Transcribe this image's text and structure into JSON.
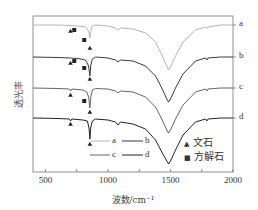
{
  "chart_data": {
    "type": "line",
    "title": "",
    "xlabel": "波数/cm⁻¹",
    "ylabel": "透光率",
    "xlim": [
      400,
      2000
    ],
    "x_ticks": [
      500,
      1000,
      1500,
      2000
    ],
    "x_minor_ticks": [
      750,
      1250,
      1750
    ],
    "grid": false,
    "legend_position": "inside lower middle/right",
    "series": [
      {
        "name": "a",
        "color": "#b5b5b5",
        "label_y": 25,
        "points": [
          [
            400,
            25
          ],
          [
            600,
            25
          ],
          [
            680,
            25.5
          ],
          [
            760,
            26
          ],
          [
            820,
            27
          ],
          [
            845,
            31
          ],
          [
            855,
            38
          ],
          [
            862,
            31
          ],
          [
            875,
            26
          ],
          [
            900,
            25
          ],
          [
            1000,
            26
          ],
          [
            1060,
            28
          ],
          [
            1080,
            30
          ],
          [
            1100,
            28
          ],
          [
            1200,
            29
          ],
          [
            1300,
            33
          ],
          [
            1380,
            42
          ],
          [
            1430,
            55
          ],
          [
            1470,
            66
          ],
          [
            1485,
            70
          ],
          [
            1500,
            67
          ],
          [
            1540,
            56
          ],
          [
            1600,
            42
          ],
          [
            1700,
            30
          ],
          [
            1780,
            27
          ],
          [
            1790,
            28.5
          ],
          [
            1800,
            27
          ],
          [
            1900,
            25
          ],
          [
            2000,
            25
          ]
        ]
      },
      {
        "name": "b",
        "color": "#3a3a3a",
        "label_y": 57,
        "points": [
          [
            400,
            57
          ],
          [
            600,
            57.5
          ],
          [
            700,
            58
          ],
          [
            760,
            58.5
          ],
          [
            820,
            60
          ],
          [
            845,
            66
          ],
          [
            855,
            76
          ],
          [
            862,
            65
          ],
          [
            875,
            59
          ],
          [
            900,
            57
          ],
          [
            1000,
            58
          ],
          [
            1060,
            60
          ],
          [
            1080,
            62
          ],
          [
            1100,
            60
          ],
          [
            1200,
            61
          ],
          [
            1300,
            66
          ],
          [
            1380,
            76
          ],
          [
            1430,
            88
          ],
          [
            1470,
            99
          ],
          [
            1485,
            102
          ],
          [
            1500,
            99
          ],
          [
            1540,
            88
          ],
          [
            1600,
            74
          ],
          [
            1700,
            61
          ],
          [
            1780,
            58
          ],
          [
            1790,
            60
          ],
          [
            1800,
            58
          ],
          [
            1900,
            57
          ],
          [
            2000,
            57
          ]
        ]
      },
      {
        "name": "c",
        "color": "#666666",
        "label_y": 88,
        "points": [
          [
            400,
            88
          ],
          [
            600,
            88.5
          ],
          [
            690,
            89
          ],
          [
            700,
            91
          ],
          [
            710,
            89
          ],
          [
            800,
            90
          ],
          [
            830,
            92
          ],
          [
            845,
            97
          ],
          [
            855,
            108
          ],
          [
            862,
            97
          ],
          [
            875,
            90
          ],
          [
            900,
            88.5
          ],
          [
            1000,
            89
          ],
          [
            1060,
            91
          ],
          [
            1080,
            93
          ],
          [
            1100,
            91
          ],
          [
            1200,
            92
          ],
          [
            1300,
            97
          ],
          [
            1380,
            107
          ],
          [
            1430,
            119
          ],
          [
            1470,
            130
          ],
          [
            1485,
            133
          ],
          [
            1500,
            130
          ],
          [
            1540,
            119
          ],
          [
            1600,
            105
          ],
          [
            1700,
            92
          ],
          [
            1780,
            89
          ],
          [
            1790,
            91
          ],
          [
            1800,
            89
          ],
          [
            1900,
            88
          ],
          [
            2000,
            88
          ]
        ]
      },
      {
        "name": "d",
        "color": "#222222",
        "label_y": 118,
        "points": [
          [
            400,
            118
          ],
          [
            600,
            118.5
          ],
          [
            690,
            119
          ],
          [
            700,
            121
          ],
          [
            710,
            119
          ],
          [
            800,
            120
          ],
          [
            835,
            121
          ],
          [
            848,
            128
          ],
          [
            855,
            139
          ],
          [
            862,
            127
          ],
          [
            875,
            121
          ],
          [
            900,
            119
          ],
          [
            1000,
            120
          ],
          [
            1060,
            122
          ],
          [
            1080,
            125
          ],
          [
            1100,
            122
          ],
          [
            1200,
            124
          ],
          [
            1300,
            129
          ],
          [
            1380,
            140
          ],
          [
            1430,
            152
          ],
          [
            1470,
            161
          ],
          [
            1485,
            164
          ],
          [
            1500,
            161
          ],
          [
            1540,
            150
          ],
          [
            1600,
            135
          ],
          [
            1700,
            122
          ],
          [
            1780,
            119
          ],
          [
            1790,
            121
          ],
          [
            1800,
            119
          ],
          [
            1900,
            118
          ],
          [
            2000,
            118
          ]
        ]
      }
    ],
    "markers": [
      {
        "type": "triangle",
        "meaning": "文石",
        "wn": 700,
        "y": 31
      },
      {
        "type": "square",
        "meaning": "方解石",
        "wn": 730,
        "y": 30
      },
      {
        "type": "square",
        "meaning": "方解石",
        "wn": 810,
        "y": 40
      },
      {
        "type": "triangle",
        "meaning": "文石",
        "wn": 855,
        "y": 48
      },
      {
        "type": "triangle",
        "meaning": "文石",
        "wn": 700,
        "y": 63
      },
      {
        "type": "square",
        "meaning": "方解石",
        "wn": 730,
        "y": 61
      },
      {
        "type": "square",
        "meaning": "方解石",
        "wn": 810,
        "y": 68
      },
      {
        "type": "triangle",
        "meaning": "文石",
        "wn": 855,
        "y": 79
      },
      {
        "type": "triangle",
        "meaning": "文石",
        "wn": 700,
        "y": 95
      },
      {
        "type": "square",
        "meaning": "方解石",
        "wn": 810,
        "y": 101
      },
      {
        "type": "triangle",
        "meaning": "文石",
        "wn": 855,
        "y": 112
      },
      {
        "type": "triangle",
        "meaning": "文石",
        "wn": 700,
        "y": 124
      },
      {
        "type": "triangle",
        "meaning": "文石",
        "wn": 855,
        "y": 144
      }
    ],
    "legend": {
      "series_rows": [
        [
          "a",
          "b"
        ],
        [
          "c",
          "d"
        ]
      ],
      "symbols": [
        {
          "symbol": "▲",
          "label": "文石"
        },
        {
          "symbol": "■",
          "label": "方解石"
        }
      ]
    },
    "annotations": [
      "▲ 文石 (aragonite) peaks near 700 and 855 cm⁻¹",
      "■ 方解石 (calcite) peaks near 712 and 875 cm⁻¹"
    ]
  }
}
